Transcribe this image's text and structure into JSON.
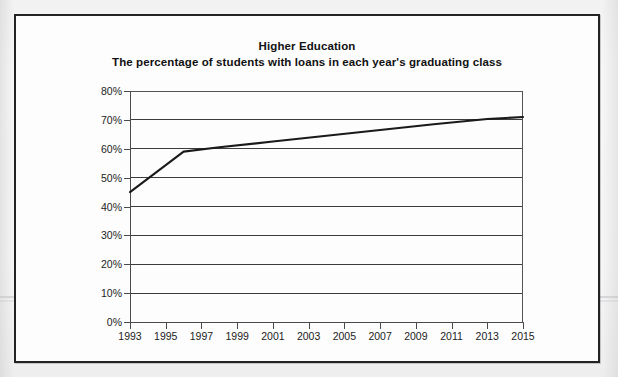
{
  "document": {
    "frame_border_color": "#232323",
    "page_background": "#f4f4f4"
  },
  "chart_data": {
    "type": "line",
    "title": "Higher Education",
    "subtitle": "The percentage of students with loans in each year's graduating class",
    "xlabel": "",
    "ylabel": "",
    "xlim": [
      1993,
      2015
    ],
    "ylim": [
      0,
      80
    ],
    "grid": true,
    "legend": "none",
    "line_color": "#1a1a1a",
    "x_tick_labels": [
      "1993",
      "1995",
      "1997",
      "1999",
      "2001",
      "2003",
      "2005",
      "2007",
      "2009",
      "2011",
      "2013",
      "2015"
    ],
    "x_ticks": [
      1993,
      1995,
      1997,
      1999,
      2001,
      2003,
      2005,
      2007,
      2009,
      2011,
      2013,
      2015
    ],
    "y_tick_labels": [
      "0%",
      "10%",
      "20%",
      "30%",
      "40%",
      "50%",
      "60%",
      "70%",
      "80%"
    ],
    "y_ticks": [
      0,
      10,
      20,
      30,
      40,
      50,
      60,
      70,
      80
    ],
    "x": [
      1993,
      1996,
      1998,
      2001,
      2004,
      2007,
      2010,
      2013,
      2015
    ],
    "values": [
      45,
      59,
      60.5,
      62.5,
      64.5,
      66.5,
      68.5,
      70.3,
      71
    ],
    "series": [
      {
        "name": "Percentage of students with loans",
        "x": [
          1993,
          1996,
          1998,
          2001,
          2004,
          2007,
          2010,
          2013,
          2015
        ],
        "values": [
          45,
          59,
          60.5,
          62.5,
          64.5,
          66.5,
          68.5,
          70.3,
          71
        ]
      }
    ]
  }
}
